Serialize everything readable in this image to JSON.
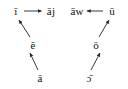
{
  "diagram": {
    "type": "vowel-shift-chain-diagram",
    "background_color": "#ffffff",
    "text_color": "#111111",
    "arrow_color": "#222222",
    "nodes": [
      {
        "id": "i",
        "label": "ī",
        "x": 16,
        "y": 11
      },
      {
        "id": "aj",
        "label": "āj",
        "x": 51,
        "y": 11
      },
      {
        "id": "aw",
        "label": "āw",
        "x": 77,
        "y": 11
      },
      {
        "id": "u",
        "label": "ū",
        "x": 112,
        "y": 11
      },
      {
        "id": "e",
        "label": "ē",
        "x": 33,
        "y": 45
      },
      {
        "id": "o",
        "label": "ō",
        "x": 96,
        "y": 45
      },
      {
        "id": "a-low",
        "label": "ā",
        "x": 40,
        "y": 78
      },
      {
        "id": "open-o",
        "label": "ɔ̄",
        "x": 89,
        "y": 78
      }
    ],
    "arrows": [
      {
        "id": "arrow-i-to-aj",
        "from": "i",
        "to": "aj",
        "direction": "right"
      },
      {
        "id": "arrow-u-to-aw",
        "from": "u",
        "to": "aw",
        "direction": "left"
      },
      {
        "id": "arrow-e-to-i",
        "from": "e",
        "to": "i",
        "direction": "up-left"
      },
      {
        "id": "arrow-a-to-e",
        "from": "a-low",
        "to": "e",
        "direction": "up-left"
      },
      {
        "id": "arrow-o-to-u",
        "from": "o",
        "to": "u",
        "direction": "up-right"
      },
      {
        "id": "arrow-openo-to-o",
        "from": "open-o",
        "to": "o",
        "direction": "up-right"
      }
    ]
  }
}
